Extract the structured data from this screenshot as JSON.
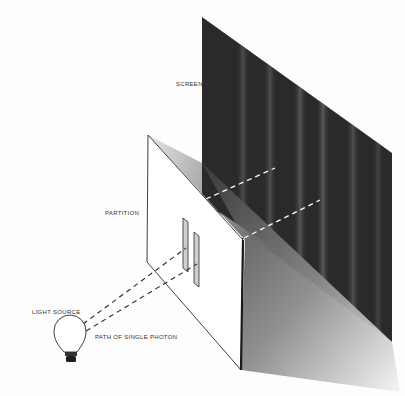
{
  "figure": {
    "labels": {
      "screen": "SCREEN",
      "partition": "PARTITION",
      "light_source": "LIGHT SOURCE",
      "photon_path": "PATH OF SINGLE PHOTON"
    },
    "colors": {
      "background": "#fdfdfd",
      "screen": "#2a2a2a",
      "fringe": "#5a5a5a",
      "partition": "#ffffff",
      "shadow_dark": "#3c3c3c",
      "shadow_light": "#f2f2f2",
      "line": "#2b2b2b"
    },
    "slit_count": 2,
    "fringe_count": 6
  }
}
